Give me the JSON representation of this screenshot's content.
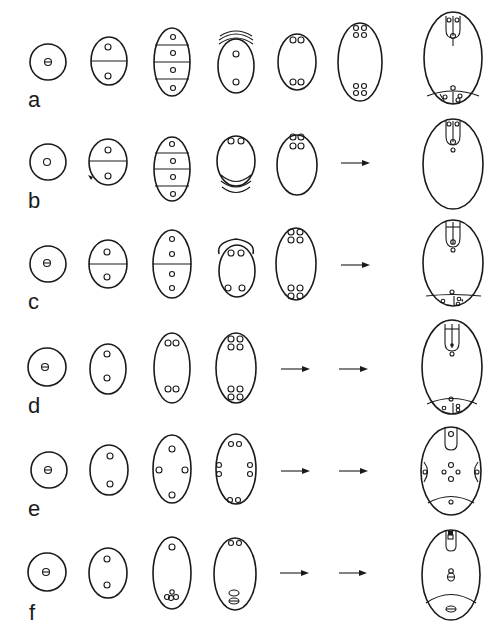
{
  "figure": {
    "type": "diagram",
    "rows": [
      {
        "label": "a",
        "stages": [
          "uninucleate",
          "2-nucleate divided",
          "4-celled tier",
          "collapsed tier with 2 nuclei",
          "4-nucleate",
          "8-nucleate",
          "mature sac"
        ],
        "arrows": 0
      },
      {
        "label": "b",
        "stages": [
          "uninucleate",
          "2-nucleate divided",
          "4-celled tier",
          "collapsed tier with 2 nuclei",
          "4-nucleate"
        ],
        "arrows": 1,
        "final": "mature sac"
      },
      {
        "label": "c",
        "stages": [
          "uninucleate",
          "2-nucleate divided",
          "4-nucleate divided",
          "collapsed cap with 4 nuclei",
          "8-nucleate"
        ],
        "arrows": 1,
        "final": "mature sac"
      },
      {
        "label": "d",
        "stages": [
          "uninucleate",
          "2-nucleate",
          "4-nucleate",
          "8-nucleate"
        ],
        "arrows": 2,
        "final": "mature sac"
      },
      {
        "label": "e",
        "stages": [
          "uninucleate",
          "2-nucleate",
          "4-nucleate tetrad",
          "8-nucleate"
        ],
        "arrows": 2,
        "final": "mature sac 16-nucleate"
      },
      {
        "label": "f",
        "stages": [
          "uninucleate",
          "2-nucleate",
          "4-nucleate",
          "4-nucleate fused"
        ],
        "arrows": 2,
        "final": "mature sac"
      }
    ],
    "stroke_color": "#1a1a1a",
    "background": "#ffffff"
  }
}
